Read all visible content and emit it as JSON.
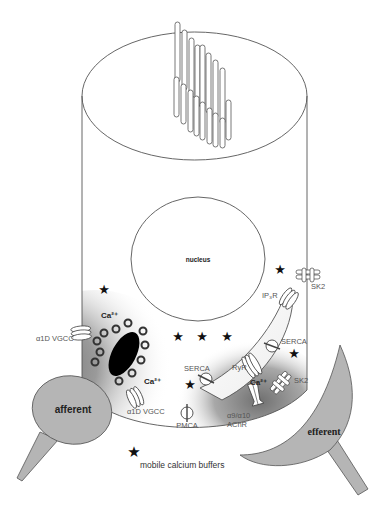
{
  "figure": {
    "labels": {
      "nucleus": "nucleus",
      "afferent": "afferent",
      "efferent": "efferent",
      "ca_left_top": "Ca²⁺",
      "ca_left_bottom": "Ca²⁺",
      "ca_right": "Ca²⁺",
      "vgcc_side": "α1D VGCC",
      "vgcc_bottom": "α1D VGCC",
      "pmca": "PMCA",
      "achr_line1": "α9/α10",
      "achr_line2": "AChR",
      "serca_left": "SERCA",
      "serca_right": "SERCA",
      "ryr": "RyR",
      "ip3r": "IP₃R",
      "sk2_top": "SK2",
      "sk2_bottom": "SK2"
    },
    "legend": {
      "symbol": "★",
      "text": "mobile calcium buffers"
    },
    "buffer_marker": "★",
    "colors": {
      "terminal_fill": "#b5b5b5",
      "ribbon_fill": "#000000",
      "line": "#555555"
    }
  }
}
